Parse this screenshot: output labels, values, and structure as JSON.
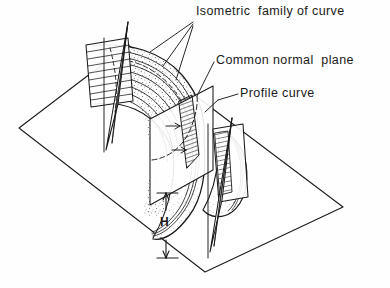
{
  "figure": {
    "background_color": "#ffffff",
    "line_color": "#1a1a1a",
    "fill_color": "#ffffff"
  },
  "labels": {
    "isometric_family": "Isometric  family of curve",
    "common_normal_plane": "Common normal  plane",
    "profile_curve": "Profile curve",
    "height_dimension": "H"
  },
  "icons": {
    "leader_line": "leader-line",
    "dimension_arrow": "dimension-arrow"
  },
  "geometry": {
    "ground_plane": {
      "shape": "parallelogram",
      "corners": [
        [
          19,
          128
        ],
        [
          128,
          45
        ],
        [
          343,
          207
        ],
        [
          205,
          272
        ]
      ]
    },
    "common_normal_plane": {
      "shape": "rectangle",
      "corners": [
        [
          150,
          119
        ],
        [
          213,
          86
        ],
        [
          213,
          170
        ],
        [
          150,
          205
        ]
      ]
    },
    "left_section_plane": {
      "shape": "quadrilateral",
      "corners": [
        [
          88,
          44
        ],
        [
          128,
          38
        ],
        [
          133,
          100
        ],
        [
          92,
          105
        ]
      ]
    },
    "right_section_plane": {
      "shape": "quadrilateral",
      "corners": [
        [
          215,
          130
        ],
        [
          243,
          126
        ],
        [
          248,
          196
        ],
        [
          219,
          200
        ]
      ]
    },
    "swept_surface": {
      "type": "curved-ribbon",
      "texture": "stippled"
    },
    "height_dimension": {
      "label": "H",
      "top_y": 193,
      "bottom_y": 258,
      "x": 166
    }
  }
}
